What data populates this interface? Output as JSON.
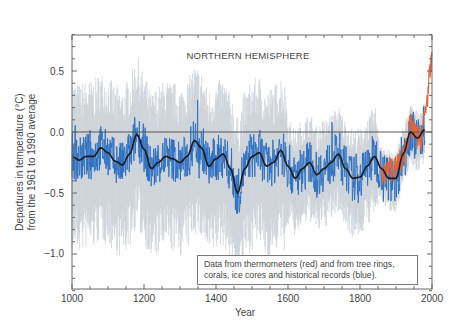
{
  "chart_data": {
    "type": "line",
    "title": "NORTHERN HEMISPHERE",
    "xlabel": "Year",
    "ylabel_line1": "Departures in temperature (°C)",
    "ylabel_line2": "from the 1961 to 1990 average",
    "xlim": [
      1000,
      2000
    ],
    "ylim": [
      -1.3,
      0.8
    ],
    "xticks": [
      1000,
      1200,
      1400,
      1600,
      1800,
      2000
    ],
    "xtick_labels": [
      "1000",
      "1200",
      "1400",
      "1600",
      "1800",
      "2000"
    ],
    "yticks": [
      0.5,
      0.0,
      -0.5,
      -1.0
    ],
    "ytick_labels": [
      "0.5",
      "0.0",
      "−0.5",
      "−1.0"
    ],
    "reference_line": 0.0,
    "legend": "Data from thermometers (red) and from tree rings, corals, ice cores and historical records (blue).",
    "legend_line1": "Data from thermometers (red) and from tree rings,",
    "legend_line2": "corals, ice cores and historical records (blue).",
    "grid": false,
    "series": [
      {
        "name": "Smoothed reconstruction (50-year)",
        "color": "#1a1a1a",
        "x": [
          1000,
          1020,
          1040,
          1060,
          1080,
          1100,
          1120,
          1140,
          1160,
          1180,
          1200,
          1220,
          1240,
          1260,
          1280,
          1300,
          1320,
          1340,
          1360,
          1380,
          1400,
          1420,
          1440,
          1460,
          1480,
          1500,
          1520,
          1540,
          1560,
          1580,
          1600,
          1620,
          1640,
          1660,
          1680,
          1700,
          1720,
          1740,
          1760,
          1780,
          1800,
          1820,
          1840,
          1860,
          1880,
          1900,
          1920,
          1940,
          1960,
          1980
        ],
        "y": [
          -0.2,
          -0.23,
          -0.2,
          -0.2,
          -0.13,
          -0.17,
          -0.24,
          -0.27,
          -0.18,
          -0.02,
          -0.14,
          -0.3,
          -0.25,
          -0.2,
          -0.22,
          -0.25,
          -0.2,
          -0.07,
          -0.13,
          -0.28,
          -0.22,
          -0.18,
          -0.3,
          -0.5,
          -0.3,
          -0.2,
          -0.17,
          -0.28,
          -0.25,
          -0.15,
          -0.28,
          -0.38,
          -0.3,
          -0.25,
          -0.35,
          -0.3,
          -0.25,
          -0.18,
          -0.3,
          -0.38,
          -0.37,
          -0.28,
          -0.2,
          -0.3,
          -0.38,
          -0.38,
          -0.18,
          0.0,
          -0.05,
          0.02
        ]
      },
      {
        "name": "Proxy annual reconstruction (tree rings, corals, ice cores, historical records)",
        "color": "#2b6fc2",
        "x_range": [
          1000,
          1980
        ],
        "typical_range": [
          -0.55,
          0.05
        ]
      },
      {
        "name": "Uncertainty band (95%)",
        "color": "#c9cfd6",
        "x_range": [
          1000,
          1980
        ],
        "typical_range": [
          -1.0,
          0.5
        ]
      },
      {
        "name": "Thermometer record",
        "color": "#e0633a",
        "x": [
          1860,
          1880,
          1900,
          1920,
          1940,
          1950,
          1960,
          1970,
          1980,
          1990,
          2000
        ],
        "y": [
          -0.38,
          -0.3,
          -0.3,
          -0.2,
          0.05,
          0.0,
          -0.05,
          -0.05,
          0.15,
          0.35,
          0.62
        ]
      }
    ]
  }
}
